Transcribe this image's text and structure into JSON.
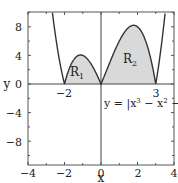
{
  "chart_data": {
    "type": "line",
    "title": "",
    "function": "y = |x^3 - x^2 - 6x|",
    "xlabel": "x",
    "ylabel": "y",
    "xlim": [
      -4,
      4
    ],
    "ylim": [
      -11.2,
      10
    ],
    "grid": false,
    "x_ticks": [
      -4,
      -2,
      0,
      2,
      4
    ],
    "x_tick_labels": [
      "−4",
      "−2",
      "0",
      "2",
      "4"
    ],
    "y_ticks": [
      -8,
      -4,
      0,
      4,
      8
    ],
    "y_tick_labels": [
      "−8",
      "−4",
      "0",
      "4",
      "8"
    ],
    "roots": [
      -2,
      0,
      3
    ],
    "root_labels": [
      "−2",
      "3"
    ],
    "regions": [
      {
        "name": "R1",
        "label_main": "R",
        "label_sub": "1",
        "x_from": -2,
        "x_to": 0,
        "fill": "#d9d9d9"
      },
      {
        "name": "R2",
        "label_main": "R",
        "label_sub": "2",
        "x_from": 0,
        "x_to": 3,
        "fill": "#d9d9d9"
      }
    ],
    "annotation": "y = |x³ − x² − 6x|",
    "annotation_parts": {
      "pre": "y = |x",
      "e1": "3",
      "mid": " − x",
      "e2": "2",
      "post": " − 6x|"
    },
    "colors": {
      "curve": "#333333",
      "fill": "#d9d9d9",
      "axis": "#444444",
      "frame": "#555555"
    }
  }
}
